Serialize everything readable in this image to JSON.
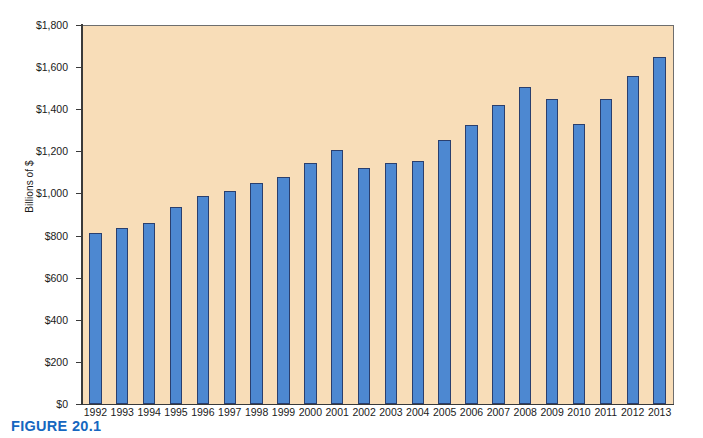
{
  "figure": {
    "caption": "FIGURE 20.1"
  },
  "chart_data": {
    "type": "bar",
    "title": "",
    "xlabel": "",
    "ylabel": "Billions of $",
    "ylim": [
      0,
      1800
    ],
    "grid": false,
    "legend": null,
    "y_ticks": [
      {
        "value": 0,
        "label": "$0"
      },
      {
        "value": 200,
        "label": "$200"
      },
      {
        "value": 400,
        "label": "$400"
      },
      {
        "value": 600,
        "label": "$600"
      },
      {
        "value": 800,
        "label": "$800"
      },
      {
        "value": 1000,
        "label": "$1,000"
      },
      {
        "value": 1200,
        "label": "$1,200"
      },
      {
        "value": 1400,
        "label": "$1,400"
      },
      {
        "value": 1600,
        "label": "$1,600"
      },
      {
        "value": 1800,
        "label": "$1,800"
      }
    ],
    "categories": [
      "1992",
      "1993",
      "1994",
      "1995",
      "1996",
      "1997",
      "1998",
      "1999",
      "2000",
      "2001",
      "2002",
      "2003",
      "2004",
      "2005",
      "2006",
      "2007",
      "2008",
      "2009",
      "2010",
      "2011",
      "2012",
      "2013"
    ],
    "values": [
      810,
      835,
      860,
      935,
      990,
      1010,
      1050,
      1080,
      1145,
      1205,
      1120,
      1145,
      1155,
      1255,
      1325,
      1420,
      1505,
      1450,
      1330,
      1450,
      1560,
      1650
    ],
    "bar_color": "#4d88d1",
    "bar_border_color": "#2a3f6e",
    "plot_background": "#f8ddb8"
  }
}
